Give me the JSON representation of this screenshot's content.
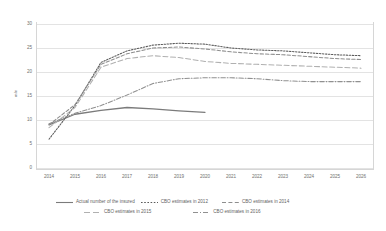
{
  "chart_data": {
    "type": "line",
    "title": "",
    "xlabel": "",
    "ylabel": "mln",
    "ylim": [
      0,
      30
    ],
    "yticks": [
      0,
      5,
      10,
      15,
      20,
      25,
      30
    ],
    "grid": true,
    "legend_position": "bottom",
    "x": [
      2014,
      2015,
      2016,
      2017,
      2018,
      2019,
      2020,
      2021,
      2022,
      2023,
      2024,
      2025,
      2026
    ],
    "categories": [
      "2014",
      "2015",
      "2016",
      "2017",
      "2018",
      "2019",
      "2020",
      "2021",
      "2022",
      "2023",
      "2024",
      "2025",
      "2026"
    ],
    "series": [
      {
        "name": "Actual number of the insured",
        "style": "solid",
        "color": "#7b7b7b",
        "values": [
          9.0,
          11.2,
          12.0,
          12.6,
          12.3,
          11.9,
          11.6,
          null,
          null,
          null,
          null,
          null,
          null
        ]
      },
      {
        "name": "CBO estimates in 2012",
        "style": "dotted",
        "color": "#5a5a5a",
        "values": [
          6.0,
          13.0,
          22.0,
          24.4,
          25.6,
          26.0,
          25.8,
          25.0,
          24.6,
          24.4,
          24.0,
          23.6,
          23.4
        ]
      },
      {
        "name": "CBO estimates in 2014",
        "style": "dashed",
        "color": "#8e8e8e",
        "values": [
          9.0,
          13.2,
          21.6,
          23.8,
          25.0,
          25.2,
          24.8,
          24.2,
          23.8,
          23.6,
          23.2,
          22.8,
          22.6
        ]
      },
      {
        "name": "CBO estimates in 2015",
        "style": "long-dash",
        "color": "#b0b0b0",
        "values": [
          8.4,
          12.6,
          21.0,
          22.8,
          23.4,
          23.0,
          22.2,
          21.8,
          21.6,
          21.4,
          21.2,
          21.0,
          20.8
        ]
      },
      {
        "name": "CBO estimates in 2016",
        "style": "dash-dot",
        "color": "#909090",
        "values": [
          9.2,
          11.4,
          13.0,
          15.2,
          17.6,
          18.6,
          18.8,
          18.8,
          18.6,
          18.2,
          18.0,
          18.0,
          18.0
        ]
      }
    ]
  },
  "axis": {
    "y_title": "mln",
    "y_ticks": [
      "0",
      "5",
      "10",
      "15",
      "20",
      "25",
      "30"
    ],
    "x_ticks": [
      "2014",
      "2015",
      "2016",
      "2017",
      "2018",
      "2019",
      "2020",
      "2021",
      "2022",
      "2023",
      "2024",
      "2025",
      "2026"
    ]
  },
  "legend": {
    "row1": [
      {
        "label": "Actual number of the insured",
        "style": "solid",
        "color": "#7b7b7b"
      },
      {
        "label": "CBO estimates in 2012",
        "style": "dotted",
        "color": "#5a5a5a"
      },
      {
        "label": "CBO estimates in 2014",
        "style": "dashed",
        "color": "#8e8e8e"
      }
    ],
    "row2": [
      {
        "label": "CBO estimates in 2015",
        "style": "long-dash",
        "color": "#b0b0b0"
      },
      {
        "label": "CBO estimates in 2016",
        "style": "dash-dot",
        "color": "#909090"
      }
    ]
  },
  "colors": {
    "grid": "#e3e3e3",
    "frame": "#d6d6d6",
    "text": "#707070",
    "background": "#ffffff"
  }
}
